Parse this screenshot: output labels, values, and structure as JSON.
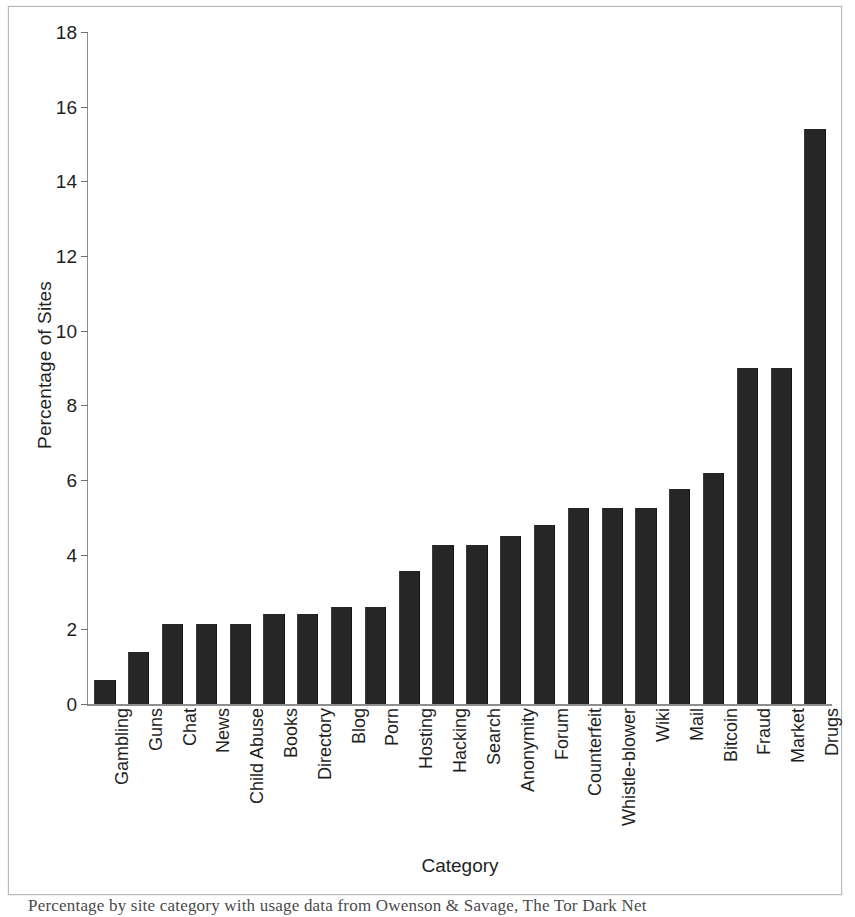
{
  "chart_data": {
    "type": "bar",
    "title": "",
    "xlabel": "Category",
    "ylabel": "Percentage of Sites",
    "ylim": [
      0,
      18
    ],
    "ytick_step": 2,
    "yticks": [
      0,
      2,
      4,
      6,
      8,
      10,
      12,
      14,
      16,
      18
    ],
    "grid": false,
    "legend": false,
    "bar_color": "#262626",
    "axis_color": "#8c8c8c",
    "categories": [
      "Gambling",
      "Guns",
      "Chat",
      "News",
      "Child Abuse",
      "Books",
      "Directory",
      "Blog",
      "Porn",
      "Hosting",
      "Hacking",
      "Search",
      "Anonymity",
      "Forum",
      "Counterfeit",
      "Whistle-blower",
      "Wiki",
      "Mail",
      "Bitcoin",
      "Fraud",
      "Market",
      "Drugs"
    ],
    "values": [
      0.65,
      1.4,
      2.15,
      2.15,
      2.15,
      2.4,
      2.4,
      2.6,
      2.6,
      3.55,
      4.25,
      4.25,
      4.5,
      4.8,
      5.25,
      5.25,
      5.25,
      5.75,
      6.2,
      9.0,
      9.0,
      15.4
    ]
  },
  "caption": {
    "partial_line": "Percentage by site category with usage data from Owenson & Savage, The Tor Dark Net"
  }
}
